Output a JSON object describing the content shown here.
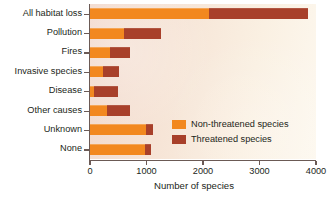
{
  "chart_data": {
    "type": "bar",
    "orientation": "horizontal",
    "stacked": true,
    "title": "",
    "xlabel": "Number of species",
    "ylabel": "",
    "xlim": [
      0,
      4000
    ],
    "xticks": [
      0,
      1000,
      2000,
      3000,
      4000
    ],
    "xticklabels": [
      "0",
      "1000",
      "2000",
      "3000",
      "4000"
    ],
    "grid": false,
    "legend_position": "inside-lower-right",
    "categories": [
      "All habitat loss",
      "Pollution",
      "Fires",
      "Invasive species",
      "Disease",
      "Other causes",
      "Unknown",
      "None"
    ],
    "series": [
      {
        "name": "Non-threatened species",
        "color": "#f2881f",
        "values": [
          2100,
          600,
          360,
          230,
          70,
          300,
          990,
          975
        ]
      },
      {
        "name": "Threatened species",
        "color": "#a8402a",
        "values": [
          1750,
          650,
          350,
          290,
          430,
          410,
          120,
          105
        ]
      }
    ],
    "totals": [
      3850,
      1250,
      710,
      520,
      500,
      710,
      1110,
      1080
    ]
  },
  "legend": {
    "items": [
      {
        "label": "Non-threatened species",
        "color": "#f2881f"
      },
      {
        "label": "Threatened species",
        "color": "#a8402a"
      }
    ]
  },
  "colors": {
    "non_threatened": "#f2881f",
    "threatened": "#a8402a",
    "axis": "#6b5a55",
    "text": "#231f20",
    "panel_left": "#f2d9cd",
    "panel_right": "#fdf8ef"
  }
}
